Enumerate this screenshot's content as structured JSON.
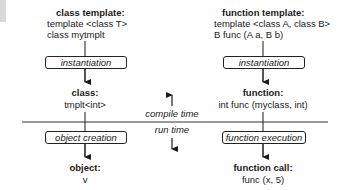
{
  "left": {
    "template_heading": "class template:",
    "template_lines": [
      "template <class T>",
      "class mytmplt"
    ],
    "step1": "instantiation",
    "result_heading": "class:",
    "result_value": "tmplt<int>",
    "step2": "object creation",
    "final_heading": "object:",
    "final_value": "v"
  },
  "right": {
    "template_heading": "function template:",
    "template_lines": [
      "template <class A, class B>",
      "B func (A a, B b)"
    ],
    "step1": "instantiation",
    "result_heading": "function:",
    "result_value": "int func (myclass, int)",
    "step2": "function execution",
    "final_heading": "function call:",
    "final_value": "func (x, 5)"
  },
  "divider": {
    "upper_label": "compile time",
    "lower_label": "run time"
  }
}
